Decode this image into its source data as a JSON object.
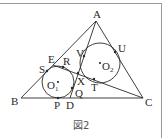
{
  "figure": {
    "caption": "図2",
    "line_color": "#2a2a2a",
    "points": {
      "A": {
        "label": "A",
        "x": 96,
        "y": 21
      },
      "B": {
        "label": "B",
        "x": 21,
        "y": 98
      },
      "C": {
        "label": "C",
        "x": 143,
        "y": 98
      },
      "D": {
        "label": "D",
        "x": 70,
        "y": 98
      },
      "E": {
        "label": "E",
        "x": 53,
        "y": 65
      },
      "S": {
        "label": "S",
        "x": 47,
        "y": 71
      },
      "R": {
        "label": "R",
        "x": 63,
        "y": 67
      },
      "V": {
        "label": "V",
        "x": 84,
        "y": 56
      },
      "U": {
        "label": "U",
        "x": 115,
        "y": 52
      },
      "X": {
        "label": "X",
        "x": 78,
        "y": 73
      },
      "T": {
        "label": "T",
        "x": 94,
        "y": 79
      },
      "Q": {
        "label": "Q",
        "x": 72,
        "y": 88
      },
      "P": {
        "label": "P",
        "x": 58,
        "y": 98
      }
    },
    "circles": [
      {
        "name": "O1",
        "label": "O",
        "sub": "1",
        "cx": 58,
        "cy": 82,
        "r": 16
      },
      {
        "name": "O2",
        "label": "O",
        "sub": "2",
        "cx": 100,
        "cy": 63,
        "r": 20
      }
    ]
  }
}
